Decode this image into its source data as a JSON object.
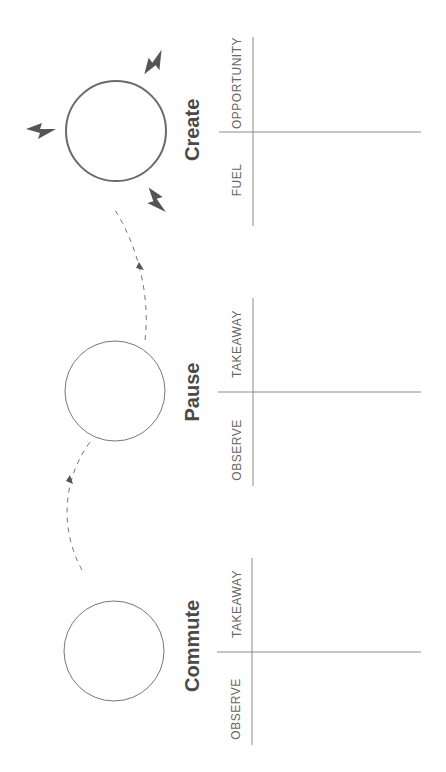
{
  "colors": {
    "stroke": "#6a6a6a",
    "bolt": "#555555",
    "text": "#4a4a4a",
    "label": "#666666",
    "line": "#8a8a8a"
  },
  "stages": [
    {
      "title": "Create",
      "labels": {
        "top": "OPPORTUNITY",
        "bottom": "FUEL"
      },
      "icons": [
        "lightning-bolt",
        "lightning-bolt",
        "lightning-bolt"
      ]
    },
    {
      "title": "Pause",
      "labels": {
        "top": "TAKEAWAY",
        "bottom": "OBSERVE"
      }
    },
    {
      "title": "Commute",
      "labels": {
        "top": "TAKEAWAY",
        "bottom": "OBSERVE"
      }
    }
  ]
}
